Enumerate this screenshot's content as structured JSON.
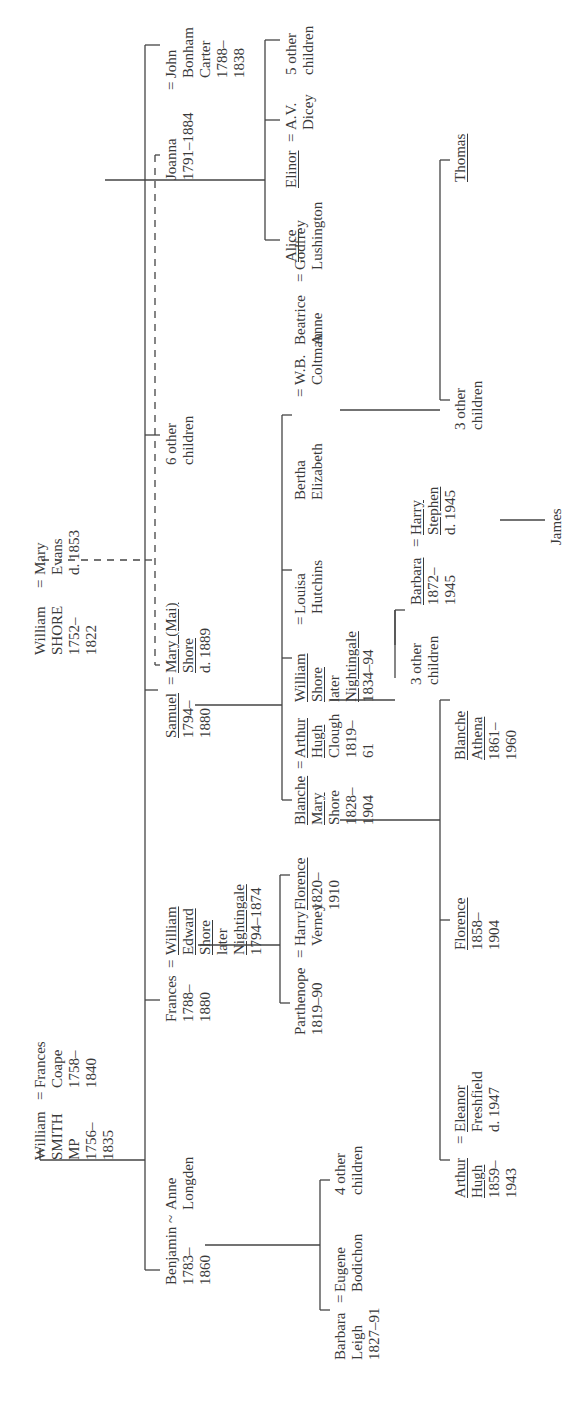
{
  "people": {
    "william_smith": {
      "lines": [
        "William",
        "SMITH",
        "MP",
        "1756–",
        "1835"
      ]
    },
    "frances_coape": {
      "lines": [
        "Frances",
        "Coape",
        "1758–",
        "1840"
      ]
    },
    "william_shore": {
      "lines": [
        "William",
        "SHORE",
        "1752–",
        "1822"
      ]
    },
    "mary_evans": {
      "lines": [
        "Mary",
        "Evans",
        "d. 1853"
      ]
    },
    "benjamin": {
      "lines": [
        "Benjamin",
        "1783–",
        "1860"
      ]
    },
    "anne_longden": {
      "lines": [
        "Anne",
        "Longden"
      ]
    },
    "frances": {
      "lines": [
        "Frances",
        "1788–",
        "1880"
      ]
    },
    "william_edward_shore": {
      "lines": [
        "William",
        "Edward",
        "Shore",
        "later",
        "Nightingale",
        "1794–1874"
      ]
    },
    "samuel": {
      "lines": [
        "Samuel",
        "1794–",
        "1880"
      ]
    },
    "mary_mai": {
      "lines": [
        "Mary (Mai)",
        "Shore",
        "d. 1889"
      ]
    },
    "six_other": {
      "lines": [
        "6 other",
        "children"
      ]
    },
    "joanna": {
      "lines": [
        "Joanna",
        "1791–1884"
      ]
    },
    "john_bonham_carter": {
      "lines": [
        "John",
        "Bonham",
        "Carter",
        "1788–",
        "1838"
      ]
    },
    "barbara_leigh": {
      "lines": [
        "Barbara",
        "Leigh",
        "1827–91"
      ]
    },
    "eugene_bodichon": {
      "lines": [
        "Eugene",
        "Bodichon"
      ]
    },
    "four_other": {
      "lines": [
        "4 other",
        "children"
      ]
    },
    "parthenope": {
      "lines": [
        "Parthenope",
        "1819–90"
      ]
    },
    "harry_verney": {
      "lines": [
        "Harry",
        "Verney"
      ]
    },
    "florence_n": {
      "lines": [
        "Florence",
        "1820–",
        "1910"
      ]
    },
    "blanche_mary": {
      "lines": [
        "Blanche",
        "Mary",
        "Shore",
        "1828–",
        "1904"
      ]
    },
    "arthur_hugh_clough": {
      "lines": [
        "Arthur",
        "Hugh",
        "Clough",
        "1819–",
        "61"
      ]
    },
    "william_shore_n": {
      "lines": [
        "William",
        "Shore",
        "later",
        "Nightingale",
        "1834–94"
      ]
    },
    "louisa_hutchins": {
      "lines": [
        "Louisa",
        "Hutchins"
      ]
    },
    "bertha_elizabeth": {
      "lines": [
        "Bertha",
        "Elizabeth"
      ]
    },
    "wb_coltman": {
      "lines": [
        "W.B.",
        "Coltman"
      ]
    },
    "beatrice_anne": {
      "lines": [
        "Beatrice",
        "Anne"
      ]
    },
    "godfrey_lushington": {
      "lines": [
        "Godfrey",
        "Lushington"
      ]
    },
    "alice": {
      "lines": [
        "Alice"
      ]
    },
    "elinor": {
      "lines": [
        "Elinor"
      ]
    },
    "av_dicey": {
      "lines": [
        "A.V.",
        "Dicey"
      ]
    },
    "five_other": {
      "lines": [
        "5 other",
        "children"
      ]
    },
    "arthur_hugh": {
      "lines": [
        "Arthur",
        "Hugh",
        "1859–",
        "1943"
      ]
    },
    "eleanor_freshfield": {
      "lines": [
        "Eleanor",
        "Freshfield",
        "d. 1947"
      ]
    },
    "florence_c": {
      "lines": [
        "Florence",
        "1858–",
        "1904"
      ]
    },
    "blanche_athena": {
      "lines": [
        "Blanche",
        "Athena",
        "1861–",
        "1960"
      ]
    },
    "three_other_a": {
      "lines": [
        "3 other",
        "children"
      ]
    },
    "barbara_s": {
      "lines": [
        "Barbara",
        "1872–",
        "1945"
      ]
    },
    "harry_stephen": {
      "lines": [
        "Harry",
        "Stephen",
        "d. 1945"
      ]
    },
    "james": {
      "lines": [
        "James"
      ]
    },
    "three_other_b": {
      "lines": [
        "3 other",
        "children"
      ]
    },
    "thomas": {
      "lines": [
        "Thomas"
      ]
    }
  },
  "symbols": {
    "married": "=",
    "partner": "~"
  }
}
